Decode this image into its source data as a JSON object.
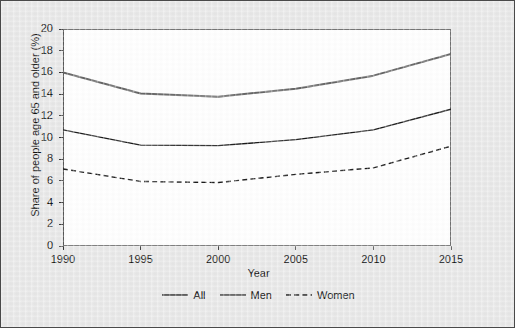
{
  "chart_data": {
    "type": "line",
    "title": "",
    "xlabel": "Year",
    "ylabel": "Share of people age 65 and older (%)",
    "x": [
      1990,
      1995,
      2000,
      2005,
      2010,
      2015
    ],
    "xlim": [
      1990,
      2015
    ],
    "ylim": [
      0,
      20
    ],
    "xticks": [
      1990,
      1995,
      2000,
      2005,
      2010,
      2015
    ],
    "xtick_labels": [
      "1990",
      "1995",
      "2000",
      "2005",
      "2010",
      "2015"
    ],
    "yticks": [
      0,
      2,
      4,
      6,
      8,
      10,
      12,
      14,
      16,
      18,
      20
    ],
    "ytick_labels": [
      "0",
      "2",
      "4",
      "6",
      "8",
      "10",
      "12",
      "14",
      "16",
      "18",
      "20"
    ],
    "grid": false,
    "legend_position": "bottom",
    "series": [
      {
        "name": "All",
        "values": [
          10.7,
          9.3,
          9.25,
          9.8,
          10.7,
          12.6
        ],
        "style": "solid",
        "color": "#1a1a1a",
        "width": 1.4
      },
      {
        "name": "Men",
        "values": [
          16.0,
          14.05,
          13.75,
          14.5,
          15.7,
          17.7
        ],
        "style": "solid",
        "color": "#666666",
        "width": 2.0
      },
      {
        "name": "Women",
        "values": [
          7.1,
          5.95,
          5.85,
          6.6,
          7.2,
          9.2
        ],
        "style": "dashed",
        "color": "#1a1a1a",
        "width": 1.4
      }
    ]
  },
  "legend": {
    "entries": [
      {
        "label": "All"
      },
      {
        "label": "Men"
      },
      {
        "label": "Women"
      }
    ]
  },
  "colors": {
    "figure_background": "#e8e8e8",
    "panel_background": "#ffffff",
    "axis": "#333333",
    "all_line": "#1a1a1a",
    "men_line": "#666666",
    "women_line": "#1a1a1a"
  }
}
